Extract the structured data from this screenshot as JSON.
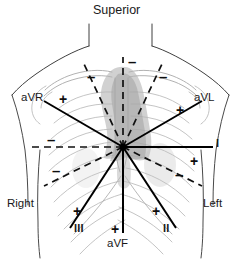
{
  "figure": {
    "kind": "hexaxial-reference-system",
    "background_color": "#ffffff",
    "line_color": "#111111",
    "anatomy_line_color": "#b9b9b9",
    "heart_shade_color": "#b0b0b0"
  },
  "orientation": {
    "superior_label": "Superior",
    "right_label": "Right",
    "left_label": "Left"
  },
  "center": {
    "x": 123,
    "y": 147,
    "note": "electrical center / convergence of all six lead axes"
  },
  "leads": [
    {
      "id": "aVR",
      "label": "aVR",
      "positive_sign": "+",
      "negative_sign": "–",
      "positive_direction": "upper-right-to-lower-left (toward right shoulder)",
      "axis_degrees": -150
    },
    {
      "id": "aVL",
      "label": "aVL",
      "positive_sign": "+",
      "negative_sign": "–",
      "positive_direction": "toward left shoulder",
      "axis_degrees": -30
    },
    {
      "id": "I",
      "label": "I",
      "positive_sign": "+",
      "negative_sign": "–",
      "positive_direction": "horizontal, toward patient left",
      "axis_degrees": 0
    },
    {
      "id": "II",
      "label": "II",
      "positive_sign": "+",
      "negative_sign": "–",
      "positive_direction": "toward left lower flank",
      "axis_degrees": 60
    },
    {
      "id": "III",
      "label": "III",
      "positive_sign": "+",
      "negative_sign": "–",
      "positive_direction": "toward right lower flank",
      "axis_degrees": 120
    },
    {
      "id": "aVF",
      "label": "aVF",
      "positive_sign": "+",
      "negative_sign": "–",
      "positive_direction": "straight inferior (foot)",
      "axis_degrees": 90
    }
  ],
  "markers": {
    "plus": "+",
    "minus": "–"
  }
}
